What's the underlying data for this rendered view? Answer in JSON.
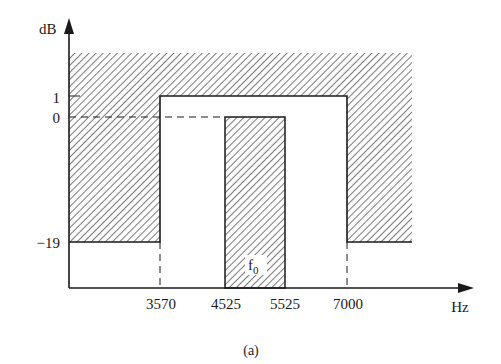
{
  "diagram": {
    "caption": "(a)",
    "y_axis": {
      "unit_label": "dB",
      "ticks": [
        {
          "value": 1,
          "label": "1"
        },
        {
          "value": 0,
          "label": "0"
        },
        {
          "value": -19,
          "label": "−19"
        }
      ]
    },
    "x_axis": {
      "unit_label": "Hz",
      "ticks": [
        {
          "value": 3570,
          "label": "3570"
        },
        {
          "value": 4525,
          "label": "4525"
        },
        {
          "value": 5525,
          "label": "5525"
        },
        {
          "value": 7000,
          "label": "7000"
        }
      ]
    },
    "regions": {
      "forbidden_mask": "Hatched area: response must stay outside (above +1 dB everywhere; above -19 dB outside 3570-7000 Hz)",
      "passband_low_hz": 3570,
      "passband_high_hz": 7000,
      "passband_max_db": 1,
      "stopband_max_db": -19,
      "center_band_low_hz": 4525,
      "center_band_high_hz": 5525,
      "center_band_max_db": 0
    },
    "center_label": "f",
    "center_label_sub": "0",
    "colors": {
      "line": "#1a1a1a",
      "hatch": "#333333",
      "background": "#ffffff"
    }
  }
}
